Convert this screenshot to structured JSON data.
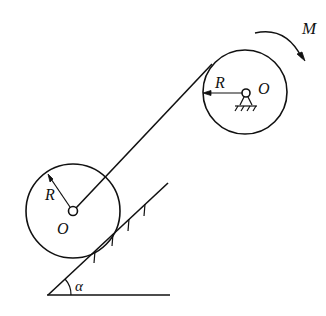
{
  "diagram": {
    "labels": {
      "moment": "M",
      "upper_radius": "R",
      "upper_center": "O",
      "lower_radius": "R",
      "lower_center": "O",
      "angle": "α"
    },
    "colors": {
      "stroke": "#111111",
      "background": "#ffffff"
    }
  }
}
